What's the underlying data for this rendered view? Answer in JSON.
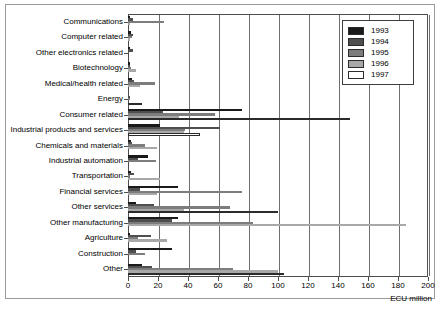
{
  "figure": {
    "units_label": "ECU million",
    "corner_mark": ""
  },
  "legend": {
    "position": "top-right",
    "entries": [
      {
        "label": "1993",
        "color": "#1a1a1a"
      },
      {
        "label": "1994",
        "color": "#4f4f4f"
      },
      {
        "label": "1995",
        "color": "#7d7d7d"
      },
      {
        "label": "1996",
        "color": "#a8a8a8"
      },
      {
        "label": "1997",
        "color": "#ffffff"
      }
    ]
  },
  "axis": {
    "ticks": [
      "0",
      "20",
      "40",
      "60",
      "80",
      "100",
      "120",
      "140",
      "160",
      "180",
      "200"
    ],
    "min": 0,
    "max": 200,
    "step": 20
  },
  "chart_data": {
    "type": "bar",
    "orientation": "horizontal",
    "title": "",
    "xlabel": "ECU million",
    "ylabel": "",
    "xlim": [
      0,
      200
    ],
    "grid": true,
    "legend_position": "top-right",
    "categories": [
      "Communications",
      "Computer related",
      "Other electronics related",
      "Biotechnology",
      "Medical/health related",
      "Energy",
      "Consumer related",
      "Industrial products and services",
      "Chemicals and materials",
      "Industrial automation",
      "Transportation",
      "Financial services",
      "Other services",
      "Other manufacturing",
      "Agriculture",
      "Construction",
      "Other"
    ],
    "series": [
      {
        "name": "1993",
        "color": "#1a1a1a",
        "values": [
          1.5,
          2.0,
          0.5,
          0.8,
          2.5,
          0.0,
          76.0,
          21.0,
          2.0,
          13.5,
          2.0,
          33.0,
          5.0,
          33.0,
          0.5,
          29.0,
          9.0
        ]
      },
      {
        "name": "1994",
        "color": "#4f4f4f",
        "values": [
          3.5,
          3.0,
          3.0,
          1.0,
          4.0,
          1.5,
          23.0,
          61.0,
          2.5,
          6.5,
          4.0,
          8.0,
          17.0,
          29.0,
          15.0,
          5.0,
          16.0
        ]
      },
      {
        "name": "1995",
        "color": "#7d7d7d",
        "values": [
          24.0,
          2.5,
          0.0,
          2.0,
          18.0,
          1.5,
          58.0,
          38.0,
          11.0,
          18.5,
          1.5,
          76.0,
          68.0,
          83.0,
          6.5,
          11.0,
          70.0
        ]
      },
      {
        "name": "1996",
        "color": "#a8a8a8",
        "values": [
          0.5,
          1.5,
          0.0,
          5.5,
          8.0,
          0.0,
          34.0,
          37.0,
          19.0,
          0.0,
          21.0,
          19.0,
          37.0,
          185.0,
          26.0,
          0.0,
          100.0
        ]
      },
      {
        "name": "1997",
        "color": "#ffffff",
        "values": [
          0.0,
          0.0,
          0.0,
          0.0,
          0.0,
          9.0,
          148.0,
          48.0,
          0.0,
          0.0,
          0.0,
          0.0,
          100.0,
          0.0,
          0.0,
          0.0,
          104.0
        ]
      }
    ]
  }
}
